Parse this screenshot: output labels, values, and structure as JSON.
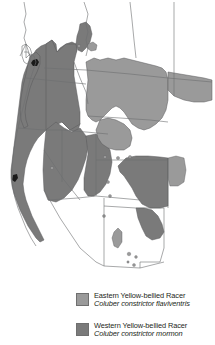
{
  "figure": {
    "type": "species-range-map",
    "background_color": "#ffffff"
  },
  "map": {
    "name": "western-united-states-range-map",
    "outline_color": "#58595b",
    "eastern_fill": "#9a9a9a",
    "western_fill": "#7a7a7a",
    "dark_accent": "#1a1a1a",
    "unoccupied_fill": "#ffffff"
  },
  "legend": {
    "entries": [
      {
        "key": "eastern",
        "swatch_color": "#9a9a9a",
        "common_name": "Eastern Yellow-bellied Racer",
        "scientific_name": "Coluber constrictor flaviventris"
      },
      {
        "key": "western",
        "swatch_color": "#7a7a7a",
        "common_name": "Western Yellow-bellied Racer",
        "scientific_name": "Coluber constrictor mormon"
      }
    ]
  }
}
